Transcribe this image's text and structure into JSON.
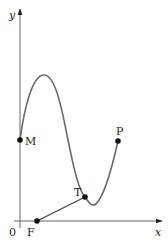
{
  "diagram": {
    "type": "function-graph",
    "axes": {
      "x_label": "x",
      "y_label": "y",
      "origin_label": "0",
      "color": "#555555"
    },
    "curve": {
      "color": "#666666",
      "description": "smooth curve starting at M on the y-axis, rising to a maximum, falling to a minimum just after T, then rising to P"
    },
    "points": [
      {
        "id": "M",
        "label": "M",
        "description": "curve meets y-axis"
      },
      {
        "id": "T",
        "label": "T",
        "description": "point on curve near local minimum"
      },
      {
        "id": "P",
        "label": "P",
        "description": "endpoint of curve"
      },
      {
        "id": "F",
        "label": "F",
        "description": "point on x-axis"
      }
    ],
    "segments": [
      {
        "from": "F",
        "to": "T",
        "description": "line segment from F to T"
      }
    ],
    "point_color": "#111111"
  }
}
